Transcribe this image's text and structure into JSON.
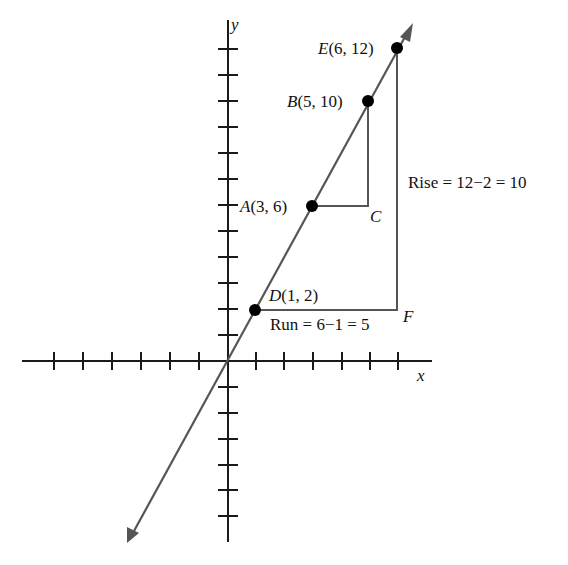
{
  "diagram": {
    "colors": {
      "axis": "#1a1a1a",
      "line": "#555555",
      "guide": "#555555",
      "point": "#000000",
      "text": "#111111"
    },
    "axes": {
      "x_label": "x",
      "y_label": "y",
      "x_ticks": [
        -6,
        -5,
        -4,
        -3,
        -2,
        -1,
        1,
        2,
        3,
        4,
        5,
        6
      ],
      "y_ticks": [
        -6,
        -5,
        -4,
        -3,
        -2,
        -1,
        1,
        2,
        3,
        4,
        5,
        6,
        7,
        8,
        9,
        10,
        11,
        12
      ]
    },
    "line": {
      "equation": "y = 2x",
      "arrows": "both ends"
    },
    "points": [
      {
        "name": "E",
        "coords": "(6, 12)",
        "x": 6,
        "y": 12
      },
      {
        "name": "B",
        "coords": "(5, 10)",
        "x": 5,
        "y": 10
      },
      {
        "name": "A",
        "coords": "(3, 6)",
        "x": 3,
        "y": 6
      },
      {
        "name": "D",
        "coords": "(1, 2)",
        "x": 1,
        "y": 2
      }
    ],
    "corner_points": [
      {
        "name": "C",
        "x": 5,
        "y": 6
      },
      {
        "name": "F",
        "x": 6,
        "y": 2
      }
    ],
    "annotations": {
      "rise": "Rise = 12−2 = 10",
      "run": "Run = 6−1 = 5"
    }
  }
}
